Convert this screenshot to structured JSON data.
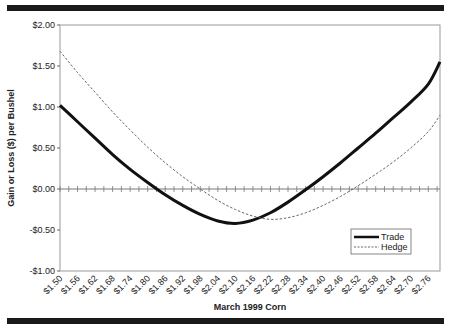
{
  "chart_data": {
    "type": "line",
    "title": "",
    "xlabel": "March 1999 Corn",
    "ylabel": "Gain or Loss ($) per Bushel",
    "ylim": [
      -1.0,
      2.0
    ],
    "y_ticks": [
      "$2.00",
      "$1.50",
      "$1.00",
      "$0.50",
      "$0.00",
      "-$0.50",
      "-$1.00"
    ],
    "categories": [
      "$1.50",
      "$1.56",
      "$1.62",
      "$1.68",
      "$1.74",
      "$1.80",
      "$1.86",
      "$1.92",
      "$1.98",
      "$2.04",
      "$2.10",
      "$2.16",
      "$2.22",
      "$2.28",
      "$2.34",
      "$2.40",
      "$2.46",
      "$2.52",
      "$2.58",
      "$2.64",
      "$2.70",
      "$2.76"
    ],
    "legend_position": "lower right",
    "grid": false,
    "series": [
      {
        "name": "Trade",
        "style": "solid-thick",
        "x": [
          1.5,
          1.56,
          1.62,
          1.68,
          1.74,
          1.8,
          1.86,
          1.92,
          1.98,
          2.04,
          2.1,
          2.16,
          2.22,
          2.28,
          2.34,
          2.4,
          2.46,
          2.52,
          2.58,
          2.64,
          2.7,
          2.76,
          2.8
        ],
        "values": [
          1.02,
          0.82,
          0.62,
          0.42,
          0.24,
          0.08,
          -0.07,
          -0.2,
          -0.31,
          -0.39,
          -0.42,
          -0.38,
          -0.29,
          -0.16,
          -0.01,
          0.15,
          0.32,
          0.5,
          0.68,
          0.87,
          1.06,
          1.28,
          1.55
        ]
      },
      {
        "name": "Hedge",
        "style": "dashed-thin",
        "x": [
          1.5,
          1.56,
          1.62,
          1.68,
          1.74,
          1.8,
          1.86,
          1.92,
          1.98,
          2.04,
          2.1,
          2.16,
          2.22,
          2.28,
          2.34,
          2.4,
          2.46,
          2.52,
          2.58,
          2.64,
          2.7,
          2.76,
          2.8
        ],
        "values": [
          1.68,
          1.42,
          1.18,
          0.94,
          0.72,
          0.51,
          0.32,
          0.15,
          0.0,
          -0.14,
          -0.25,
          -0.33,
          -0.37,
          -0.35,
          -0.29,
          -0.2,
          -0.09,
          0.04,
          0.18,
          0.33,
          0.5,
          0.7,
          0.9
        ]
      }
    ]
  }
}
